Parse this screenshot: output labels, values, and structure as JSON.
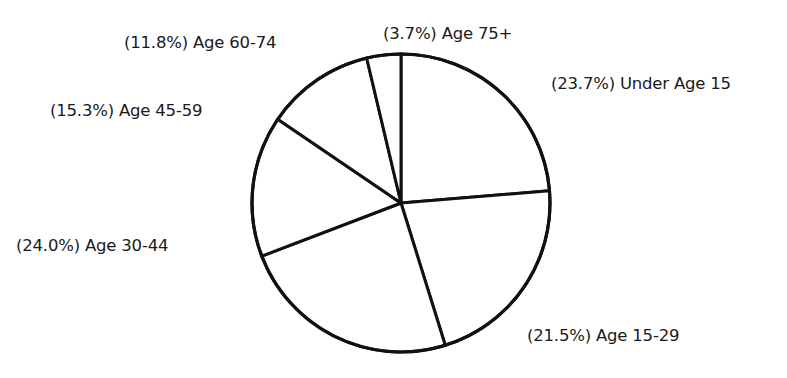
{
  "chart_data": {
    "type": "pie",
    "title": "",
    "start_angle_deg": 0,
    "direction": "clockwise",
    "slices": [
      {
        "label": "Under Age 15",
        "value": 23.7,
        "display": "(23.7%) Under Age 15"
      },
      {
        "label": "Age 15-29",
        "value": 21.5,
        "display": "(21.5%) Age 15-29"
      },
      {
        "label": "Age 30-44",
        "value": 24.0,
        "display": "(24.0%) Age 30-44"
      },
      {
        "label": "Age 45-59",
        "value": 15.3,
        "display": "(15.3%) Age 45-59"
      },
      {
        "label": "Age 60-74",
        "value": 11.8,
        "display": "(11.8%) Age 60-74"
      },
      {
        "label": "Age 75+",
        "value": 3.7,
        "display": "(3.7%) Age 75+"
      }
    ],
    "fill_color": "#ffffff",
    "stroke_color": "#111111"
  },
  "labels": {
    "under_15": "(23.7%) Under Age 15",
    "age_15_29": "(21.5%) Age 15-29",
    "age_30_44": "(24.0%) Age 30-44",
    "age_45_59": "(15.3%) Age 45-59",
    "age_60_74": "(11.8%) Age 60-74",
    "age_75_plus": "(3.7%) Age 75+"
  }
}
